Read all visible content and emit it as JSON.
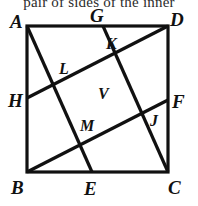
{
  "header": {
    "text": "pair of sides of the inner"
  },
  "figure": {
    "name": "square-with-inscribed-parallelogram",
    "stroke_color": "#111111",
    "background_color": "#ffffff",
    "outer_stroke_width": 3.2,
    "inner_stroke_width": 3.2,
    "square": {
      "name": "square-ABCD",
      "x1": 27,
      "y1": 26,
      "x2": 168,
      "y2": 172
    },
    "lines": [
      {
        "name": "line-A-E",
        "x1": 27,
        "y1": 26,
        "x2": 92,
        "y2": 172
      },
      {
        "name": "line-G-C",
        "x1": 103,
        "y1": 26,
        "x2": 168,
        "y2": 172
      },
      {
        "name": "line-H-D",
        "x1": 27,
        "y1": 98,
        "x2": 168,
        "y2": 26
      },
      {
        "name": "line-B-F",
        "x1": 27,
        "y1": 172,
        "x2": 168,
        "y2": 100
      }
    ],
    "outer_labels": [
      {
        "name": "label-A",
        "text": "A",
        "x": 10,
        "y": 12
      },
      {
        "name": "label-G",
        "text": "G",
        "x": 90,
        "y": 6
      },
      {
        "name": "label-D",
        "text": "D",
        "x": 170,
        "y": 10
      },
      {
        "name": "label-H",
        "text": "H",
        "x": 8,
        "y": 91
      },
      {
        "name": "label-F",
        "text": "F",
        "x": 172,
        "y": 92
      },
      {
        "name": "label-B",
        "text": "B",
        "x": 11,
        "y": 178
      },
      {
        "name": "label-E",
        "text": "E",
        "x": 84,
        "y": 179
      },
      {
        "name": "label-C",
        "text": "C",
        "x": 168,
        "y": 178
      }
    ],
    "inner_labels": [
      {
        "name": "label-K",
        "text": "K",
        "x": 106,
        "y": 36
      },
      {
        "name": "label-L",
        "text": "L",
        "x": 59,
        "y": 61
      },
      {
        "name": "label-V",
        "text": "V",
        "x": 98,
        "y": 86
      },
      {
        "name": "label-M",
        "text": "M",
        "x": 80,
        "y": 118
      },
      {
        "name": "label-J",
        "text": "J",
        "x": 150,
        "y": 113
      }
    ]
  }
}
